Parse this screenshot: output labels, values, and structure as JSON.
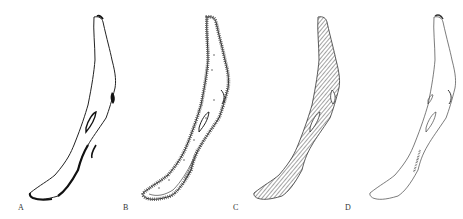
{
  "figure": {
    "panels": [
      {
        "label": "A",
        "style": "outline-with-dark-shore"
      },
      {
        "label": "B",
        "style": "outline-with-dotted-shore-zones"
      },
      {
        "label": "C",
        "style": "hatched-fill"
      },
      {
        "label": "D",
        "style": "thin-outline"
      }
    ]
  },
  "colors": {
    "stroke": "#222222",
    "background": "#ffffff"
  }
}
